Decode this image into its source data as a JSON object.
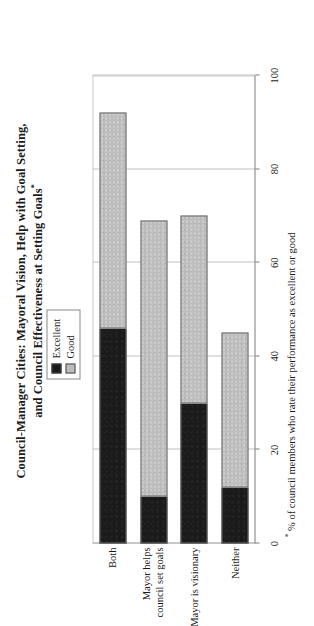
{
  "chart_data": {
    "type": "bar",
    "orientation": "horizontal-stacked",
    "title": "Council-Manager Cities: Mayoral Vision, Help with Goal Setting, and Council Effectiveness at Setting Goals",
    "title_line1": "Council-Manager Cities: Mayoral Vision, Help with Goal Setting,",
    "title_line2": "and Council Effectiveness at Setting Goals",
    "title_marker": "*",
    "footnote_marker": "*",
    "footnote": "% of council members who rate their performance as excellent or good",
    "xlabel": "",
    "ylabel": "",
    "xlim": [
      0,
      100
    ],
    "ticks": [
      0,
      20,
      40,
      60,
      80,
      100
    ],
    "tick_labels": [
      "0",
      "20",
      "40",
      "60",
      "80",
      "100"
    ],
    "grid": true,
    "legend_position": "top-right",
    "categories": [
      "Both",
      "Mayor helps\ncouncil set goals",
      "Mayor is visionary",
      "Neither"
    ],
    "category_labels": [
      "Both",
      "Mayor helps\ncouncil set goals",
      "Mayor is visionary",
      "Neither"
    ],
    "series": [
      {
        "name": "Excellent",
        "color": "#1a1a1a",
        "values": [
          46,
          10,
          30,
          12
        ]
      },
      {
        "name": "Good",
        "color": "#bdbdbd",
        "values": [
          46,
          59,
          40,
          33
        ]
      }
    ],
    "totals": [
      92,
      69,
      70,
      45
    ]
  },
  "legend": {
    "items": [
      {
        "label": "Excellent",
        "color": "#1a1a1a"
      },
      {
        "label": "Good",
        "color": "#bdbdbd"
      }
    ]
  }
}
